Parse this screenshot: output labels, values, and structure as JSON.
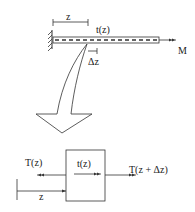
{
  "diagram": {
    "top": {
      "dimension_label": "z",
      "distributed_torque_label": "t(z)",
      "increment_label": "Δz",
      "applied_moment_label": "M"
    },
    "bottom": {
      "left_torque_label": "T(z)",
      "distributed_torque_label": "t(z)",
      "right_torque_label": "T(z + Δz)",
      "position_label": "z"
    },
    "colors": {
      "stroke": "#333333",
      "background": "#ffffff"
    }
  }
}
